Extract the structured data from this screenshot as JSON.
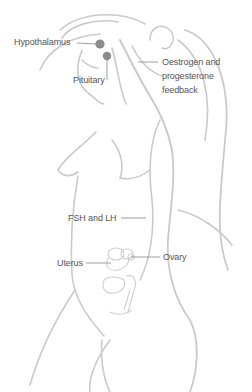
{
  "diagram": {
    "type": "anatomical illustration",
    "line_color": "#c8c8c8",
    "dot_color": "#8a8a8a",
    "label_color": "#555555",
    "labels": {
      "hypothalamus": "Hypothalamus",
      "pituitary": "Pituitary",
      "feedback_line1": "Oestrogen and",
      "feedback_line2": "progesterone",
      "feedback_line3": "feedback",
      "fsh_lh": "FSH and LH",
      "uterus": "Uterus",
      "ovary": "Ovary"
    }
  }
}
